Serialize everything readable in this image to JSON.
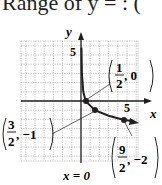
{
  "header": {
    "title_text": "Range of y = : ("
  },
  "chart_data": {
    "type": "line",
    "title": "",
    "xlabel": "x",
    "ylabel": "y",
    "xlim": [
      -6.5,
      6
    ],
    "ylim": [
      -6.5,
      6.5
    ],
    "grid": true,
    "axis_tick_labels": {
      "x": [
        "5"
      ],
      "y": [
        "5"
      ]
    },
    "asymptote": {
      "label": "x = 0",
      "x": 0
    },
    "curve": {
      "description": "logarithmic-type curve with vertical asymptote x = 0, decreasing",
      "points": [
        [
          0.05,
          5.8
        ],
        [
          0.1,
          3.0
        ],
        [
          0.25,
          1.0
        ],
        [
          0.5,
          0
        ],
        [
          1.0,
          -0.5
        ],
        [
          1.5,
          -1
        ],
        [
          3.0,
          -1.6
        ],
        [
          4.5,
          -2
        ],
        [
          5.6,
          -2.2
        ]
      ]
    },
    "labeled_points": [
      {
        "x": 0.5,
        "y": 0,
        "label_num": "1",
        "label_den": "2",
        "label_rest": ", 0"
      },
      {
        "x": 1.5,
        "y": -1,
        "label_num": "3",
        "label_den": "2",
        "label_rest": ", −1"
      },
      {
        "x": 4.5,
        "y": -2,
        "label_num": "9",
        "label_den": "2",
        "label_rest": ", −2"
      }
    ]
  }
}
